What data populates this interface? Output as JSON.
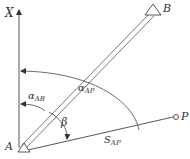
{
  "diagram": {
    "axis_label": "X",
    "points": {
      "A": "A",
      "B": "B",
      "P": "P"
    },
    "angles": {
      "alpha_ab": {
        "symbol": "α",
        "sub": "AB"
      },
      "alpha_ap": {
        "symbol": "α",
        "sub": "AP"
      },
      "beta": "β"
    },
    "distance": {
      "symbol": "S",
      "sub": "AP"
    },
    "colors": {
      "line": "#444444",
      "text": "#333333",
      "background": "#ffffff"
    }
  }
}
